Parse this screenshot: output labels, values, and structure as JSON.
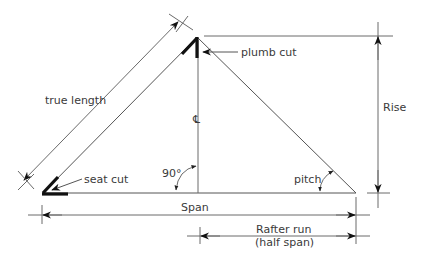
{
  "diagram": {
    "labels": {
      "true_length": "true length",
      "plumb_cut": "plumb cut",
      "seat_cut": "seat cut",
      "centerline": "℄",
      "right_angle": "90°",
      "pitch": "pitch",
      "rise": "Rise",
      "span": "Span",
      "rafter_run_line1": "Rafter run",
      "rafter_run_line2": "(half span)"
    },
    "colors": {
      "line": "#666666",
      "heavy": "#111111",
      "text": "#3a3a3a",
      "background": "#ffffff"
    }
  }
}
